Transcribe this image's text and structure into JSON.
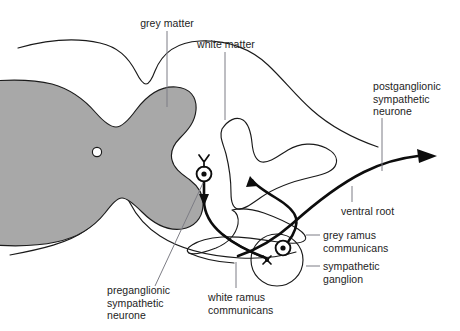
{
  "figure": {
    "colors": {
      "grey_matter_fill": "#a8a8a8",
      "outline": "#1a1a1a",
      "neuron": "#0d0d0d",
      "leader_line": "#7d7d85",
      "background": "#ffffff"
    }
  },
  "labels": {
    "grey_matter": "grey matter",
    "white_matter": "white matter",
    "postganglionic_sympathetic_neurone": "postganglionic\nsympathetic\nneurone",
    "ventral_root": "ventral root",
    "grey_ramus_communicans": "grey ramus\ncommunicans",
    "sympathetic_ganglion": "sympathetic\nganglion",
    "white_ramus_communicans": "white ramus\ncommunicans",
    "preganglionic_sympathetic_neurone": "preganglionic\nsympathetic\nneurone"
  },
  "structures": [
    {
      "name": "spinal-cord-outline",
      "kind": "outline"
    },
    {
      "name": "grey-matter-butterfly",
      "kind": "filled-region",
      "fill": "#a8a8a8"
    },
    {
      "name": "central-canal",
      "kind": "small-circle"
    },
    {
      "name": "ventral-root-sheath",
      "kind": "outline"
    },
    {
      "name": "spinal-nerve-sheath",
      "kind": "outline"
    },
    {
      "name": "sympathetic-ganglion-capsule",
      "kind": "circle"
    },
    {
      "name": "preganglionic-neurone-soma",
      "kind": "soma"
    },
    {
      "name": "postganglionic-neurone-soma",
      "kind": "soma"
    },
    {
      "name": "preganglionic-axon",
      "kind": "axon"
    },
    {
      "name": "postganglionic-axon",
      "kind": "axon"
    }
  ]
}
